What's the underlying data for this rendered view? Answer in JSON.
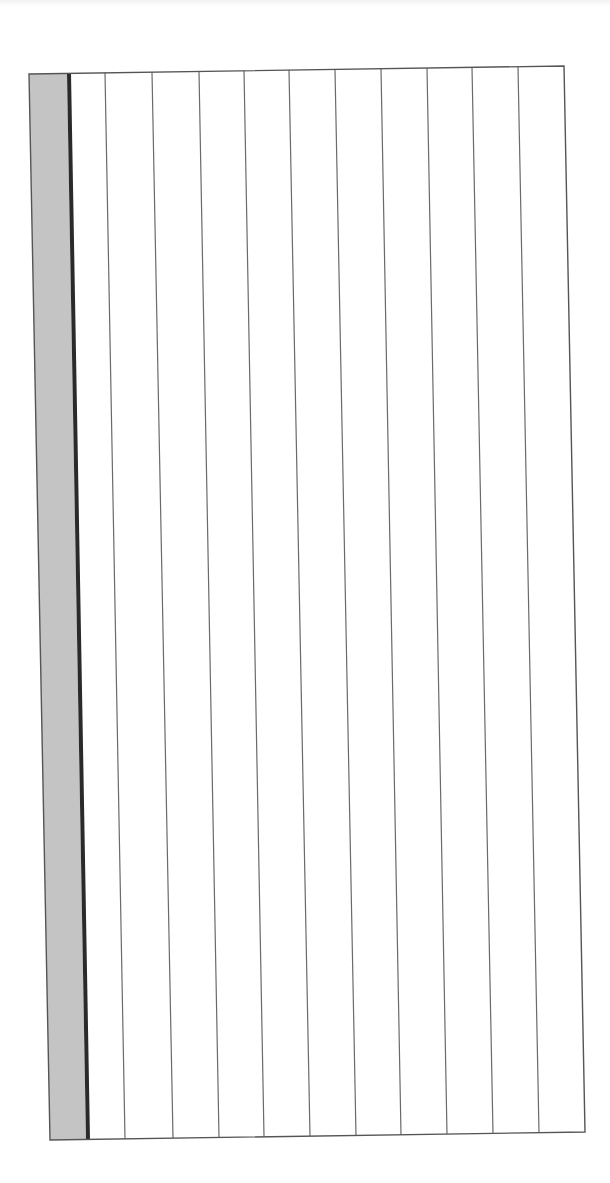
{
  "document": {
    "type": "blank ruled sheet (scanned, rotated)",
    "page_background": "#ffffff",
    "sheet": {
      "fill": "#ffffff",
      "border_color": "#555555",
      "corners": {
        "top_left": [
          29,
          74
        ],
        "top_right": [
          564,
          66
        ],
        "bottom_right": [
          585,
          1132
        ],
        "bottom_left": [
          50,
          1140
        ]
      }
    },
    "margin_strip": {
      "fill": "#c4c4c4",
      "top": [
        29,
        67
      ],
      "bottom": [
        50,
        86
      ]
    },
    "margin_rule": {
      "color": "#2a2a2a",
      "width": 4,
      "top_x": 69,
      "bottom_x": 88
    },
    "rules": {
      "color": "#6a6a6a",
      "width": 1.2,
      "lines": [
        {
          "top_x": 105,
          "bottom_x": 125
        },
        {
          "top_x": 152,
          "bottom_x": 173
        },
        {
          "top_x": 199,
          "bottom_x": 219
        },
        {
          "top_x": 244,
          "bottom_x": 264
        },
        {
          "top_x": 289,
          "bottom_x": 310
        },
        {
          "top_x": 335,
          "bottom_x": 356
        },
        {
          "top_x": 381,
          "bottom_x": 401
        },
        {
          "top_x": 427,
          "bottom_x": 447
        },
        {
          "top_x": 472,
          "bottom_x": 493
        },
        {
          "top_x": 518,
          "bottom_x": 539
        }
      ]
    }
  }
}
